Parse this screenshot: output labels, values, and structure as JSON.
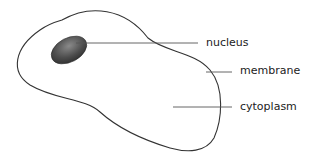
{
  "diagram": {
    "title": "",
    "labels": {
      "nucleus": "nucleus",
      "membrane": "membrane",
      "cytoplasm": "cytoplasm"
    },
    "colors": {
      "outline": "#333333",
      "nucleus_fill": "#555555",
      "leader_line": "#555555",
      "text": "#222222"
    }
  }
}
